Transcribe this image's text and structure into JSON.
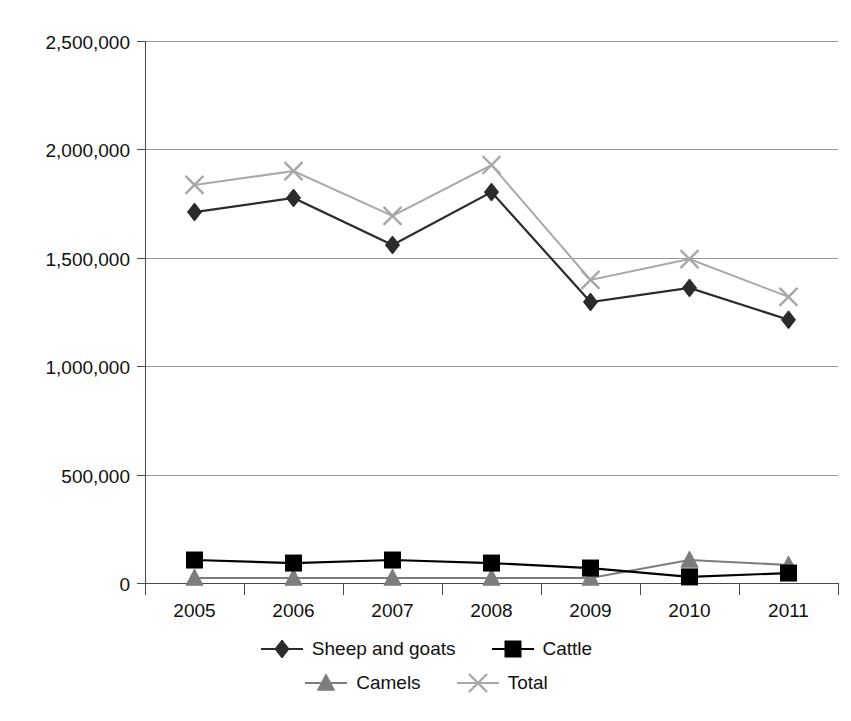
{
  "chart_data": {
    "type": "line",
    "title": "",
    "xlabel": "",
    "ylabel": "",
    "categories": [
      "2005",
      "2006",
      "2007",
      "2008",
      "2009",
      "2010",
      "2011"
    ],
    "ylim": [
      0,
      2500000
    ],
    "yticks": [
      0,
      500000,
      1000000,
      1500000,
      2000000,
      2500000
    ],
    "ytick_labels": [
      "0",
      "500,000",
      "1,000,000",
      "1,500,000",
      "2,000,000",
      "2,500,000"
    ],
    "grid": true,
    "legend_position": "bottom",
    "series": [
      {
        "name": "Sheep and goats",
        "marker": "diamond",
        "color": "#2b2b2b",
        "values": [
          1711000,
          1776000,
          1559000,
          1803000,
          1296000,
          1361000,
          1214000
        ]
      },
      {
        "name": "Cattle",
        "marker": "square",
        "color": "#000000",
        "values": [
          106000,
          92000,
          106000,
          92000,
          69000,
          28000,
          46000
        ]
      },
      {
        "name": "Camels",
        "marker": "triangle",
        "color": "#7d7d7d",
        "values": [
          23000,
          23000,
          23000,
          23000,
          23000,
          106000,
          83000
        ]
      },
      {
        "name": "Total",
        "marker": "cross",
        "color": "#a8a8a8",
        "values": [
          1836000,
          1900000,
          1693000,
          1928000,
          1398000,
          1494000,
          1320000
        ]
      }
    ]
  },
  "legend": {
    "rows": [
      [
        "Sheep and goats",
        "Cattle"
      ],
      [
        "Camels",
        "Total"
      ]
    ]
  },
  "colors": {
    "sheep_and_goats": "#2b2b2b",
    "cattle": "#000000",
    "camels": "#7d7d7d",
    "total": "#a8a8a8",
    "gridline": "#9a9a9a",
    "axis": "#4a4a4a",
    "text": "#111111",
    "background": "#ffffff"
  }
}
